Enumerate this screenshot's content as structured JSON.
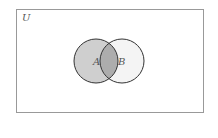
{
  "diagram": {
    "type": "venn",
    "universe_label": "U",
    "sets": [
      {
        "label": "A",
        "cx": 96,
        "cy": 61,
        "r": 22,
        "fill": "#cccccc"
      },
      {
        "label": "B",
        "cx": 122,
        "cy": 61,
        "r": 22,
        "fill": "#f2f2f2"
      }
    ],
    "intersection_fill": "#aaaaaa",
    "shaded_region": "A",
    "universe_rect": {
      "x": 16,
      "y": 9,
      "width": 187,
      "height": 104,
      "stroke": "#999999"
    },
    "stroke_color": "#333333"
  }
}
